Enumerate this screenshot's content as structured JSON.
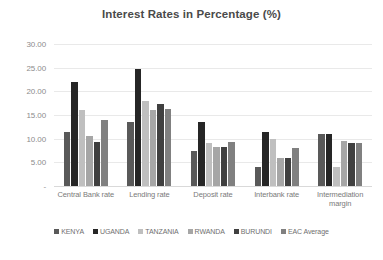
{
  "chart_data": {
    "type": "bar",
    "title": "Interest Rates in Percentage (%)",
    "xlabel": "",
    "ylabel": "",
    "ylim": [
      0,
      30
    ],
    "ytick_labels": [
      "30.00",
      "25.00",
      "20.00",
      "15.00",
      "10.00",
      "5.00",
      "-"
    ],
    "ytick_values": [
      30,
      25,
      20,
      15,
      10,
      5,
      0
    ],
    "grid": true,
    "legend_position": "bottom",
    "categories": [
      "Central Bank rate",
      "Lending rate",
      "Deposit rate",
      "Interbank rate",
      "Intermediation margin"
    ],
    "series": [
      {
        "name": "KENYA",
        "color": "#595959",
        "values": [
          11.5,
          13.5,
          7.5,
          4.0,
          11.0
        ]
      },
      {
        "name": "UGANDA",
        "color": "#262626",
        "values": [
          22.0,
          24.7,
          13.5,
          11.5,
          11.0
        ]
      },
      {
        "name": "TANZANIA",
        "color": "#bfbfbf",
        "values": [
          16.0,
          18.0,
          9.0,
          10.0,
          4.0
        ]
      },
      {
        "name": "RWANDA",
        "color": "#a6a6a6",
        "values": [
          10.5,
          16.0,
          8.3,
          6.0,
          9.5
        ]
      },
      {
        "name": "BURUNDI",
        "color": "#404040",
        "values": [
          9.3,
          17.3,
          8.3,
          6.0,
          9.0
        ]
      },
      {
        "name": "EAC Average",
        "color": "#808080",
        "values": [
          14.0,
          16.3,
          9.3,
          8.0,
          9.0
        ]
      }
    ]
  }
}
